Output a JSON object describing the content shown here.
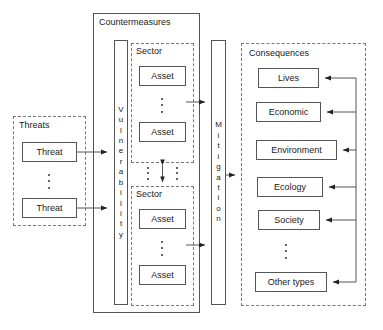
{
  "diagram": {
    "groups": {
      "threats": {
        "label": "Threats",
        "style": "dashed"
      },
      "countermeasures": {
        "label": "Countermeasures",
        "style": "solid"
      },
      "sector_top": {
        "label": "Sector",
        "style": "dashed"
      },
      "sector_bottom": {
        "label": "Sector",
        "style": "dashed"
      },
      "consequences": {
        "label": "Consequences",
        "style": "dashed"
      }
    },
    "threat_nodes": [
      {
        "label": "Threat"
      },
      {
        "label": "Threat"
      }
    ],
    "vulnerability_bar": {
      "label": "Vulnerability",
      "letters": [
        "V",
        "u",
        "l",
        "n",
        "e",
        "r",
        "a",
        "b",
        "i",
        "l",
        "i",
        "t",
        "y"
      ]
    },
    "mitigation_bar": {
      "label": "Mitigation",
      "letters": [
        "M",
        "i",
        "t",
        "i",
        "g",
        "a",
        "t",
        "i",
        "o",
        "n"
      ]
    },
    "sector_top_assets": [
      {
        "label": "Asset"
      },
      {
        "label": "Asset"
      }
    ],
    "sector_bottom_assets": [
      {
        "label": "Asset"
      },
      {
        "label": "Asset"
      }
    ],
    "consequence_nodes": [
      {
        "label": "Lives"
      },
      {
        "label": "Economic"
      },
      {
        "label": "Environment"
      },
      {
        "label": "Ecology"
      },
      {
        "label": "Society"
      },
      {
        "label": "Other types"
      }
    ],
    "ellipses": [
      {
        "name": "threats-ellipsis"
      },
      {
        "name": "sector-top-ellipsis"
      },
      {
        "name": "sector-bottom-ellipsis"
      },
      {
        "name": "sector-gap-ellipsis-left"
      },
      {
        "name": "sector-gap-ellipsis-right"
      },
      {
        "name": "consequences-ellipsis"
      }
    ],
    "connectors": [
      {
        "name": "threat-1-to-vulnerability",
        "type": "arrow"
      },
      {
        "name": "threat-2-to-vulnerability",
        "type": "arrow"
      },
      {
        "name": "sector-top-to-mitigation",
        "type": "arrow"
      },
      {
        "name": "sector-bottom-to-mitigation",
        "type": "arrow"
      },
      {
        "name": "mitigation-to-consequences",
        "type": "arrow"
      },
      {
        "name": "sector-to-sector-bidirectional",
        "type": "double-arrow"
      },
      {
        "name": "feedback-bus-to-lives",
        "type": "arrow"
      },
      {
        "name": "feedback-bus-to-economic",
        "type": "arrow"
      },
      {
        "name": "feedback-bus-to-environment",
        "type": "arrow"
      },
      {
        "name": "feedback-bus-to-ecology",
        "type": "arrow"
      },
      {
        "name": "feedback-bus-to-society",
        "type": "arrow"
      },
      {
        "name": "feedback-bus-to-other-types",
        "type": "arrow"
      }
    ],
    "colors": {
      "stroke": "#555555",
      "dashed_stroke": "#777777",
      "text": "#1a1a1a",
      "background": "#ffffff"
    }
  }
}
